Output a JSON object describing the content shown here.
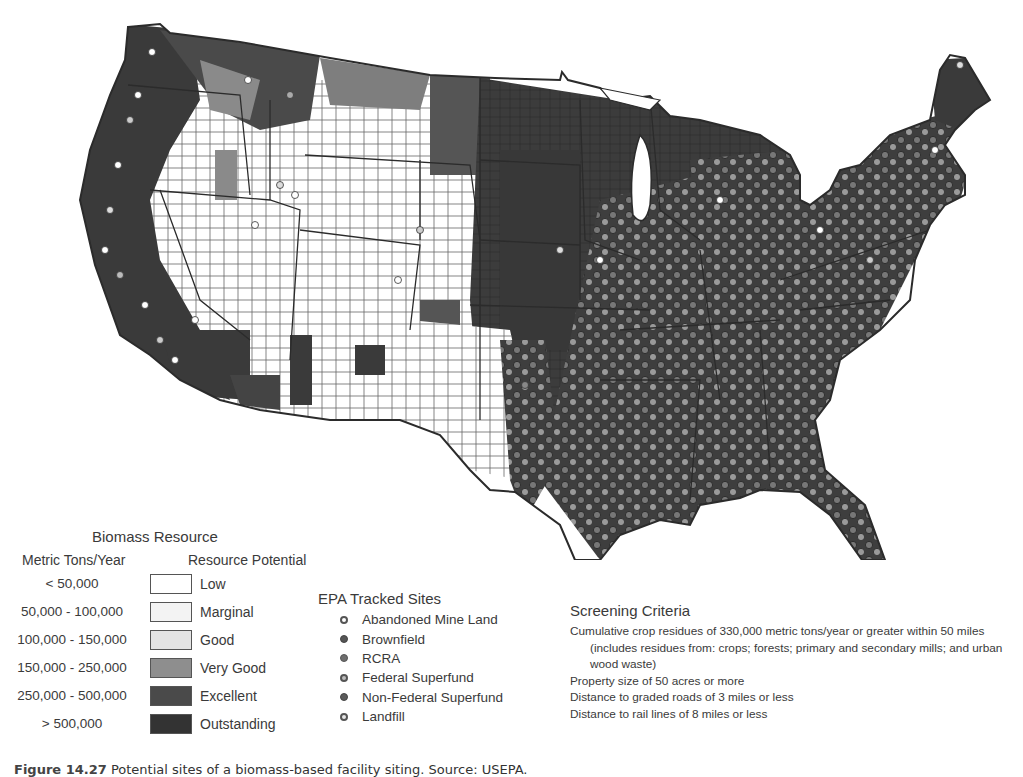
{
  "map": {
    "subject": "Contiguous United States county-level biomass resource map with EPA tracked sites",
    "colors": {
      "outline": "#2b2b2b",
      "county_line": "#555555"
    }
  },
  "biomass_legend": {
    "title": "Biomass Resource",
    "col_metric": "Metric Tons/Year",
    "col_potential": "Resource Potential",
    "rows": [
      {
        "range": "< 50,000",
        "label": "Low",
        "color": "#ffffff"
      },
      {
        "range": "50,000 - 100,000",
        "label": "Marginal",
        "color": "#f3f3f3"
      },
      {
        "range": "100,000 - 150,000",
        "label": "Good",
        "color": "#e4e4e4"
      },
      {
        "range": "150,000 - 250,000",
        "label": "Very Good",
        "color": "#8e8e8e"
      },
      {
        "range": "250,000 - 500,000",
        "label": "Excellent",
        "color": "#4a4a4a"
      },
      {
        "range": "> 500,000",
        "label": "Outstanding",
        "color": "#333333"
      }
    ]
  },
  "epa_legend": {
    "title": "EPA Tracked Sites",
    "items": [
      {
        "label": "Abandoned Mine Land",
        "fill": "#ffffff",
        "stroke": "#555555"
      },
      {
        "label": "Brownfield",
        "fill": "#555555",
        "stroke": "#444444"
      },
      {
        "label": "RCRA",
        "fill": "#6e6e6e",
        "stroke": "#555555"
      },
      {
        "label": "Federal Superfund",
        "fill": "#bdbdbd",
        "stroke": "#555555"
      },
      {
        "label": "Non-Federal Superfund",
        "fill": "#5a5a5a",
        "stroke": "#444444"
      },
      {
        "label": "Landfill",
        "fill": "#e6e6e6",
        "stroke": "#555555"
      }
    ]
  },
  "screening": {
    "title": "Screening Criteria",
    "items": [
      "Cumulative crop residues of 330,000 metric tons/year or greater within 50 miles (includes residues from: crops; forests; primary and secondary mills; and urban wood waste)",
      "Property size of 50 acres or more",
      "Distance to graded roads of 3 miles or less",
      "Distance to rail lines of 8 miles or less"
    ]
  },
  "caption": {
    "figure": "Figure 14.27",
    "text": "Potential sites of a biomass-based facility siting. Source: USEPA."
  }
}
